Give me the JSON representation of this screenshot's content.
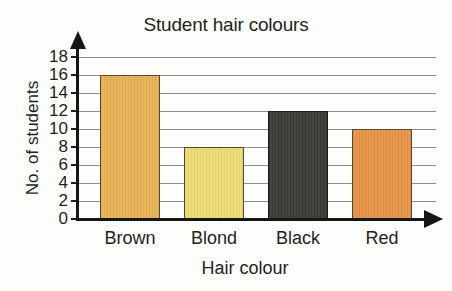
{
  "chart_data": {
    "type": "bar",
    "title": "Student hair colours",
    "xlabel": "Hair colour",
    "ylabel": "No. of students",
    "categories": [
      "Brown",
      "Blond",
      "Black",
      "Red"
    ],
    "values": [
      16,
      8,
      12,
      10
    ],
    "bar_colors": [
      "#e8b254",
      "#ecdc72",
      "#3a3936",
      "#e89247"
    ],
    "ylim": [
      0,
      18
    ],
    "ytick_step": 2,
    "ytick_labels": [
      "0",
      "2",
      "4",
      "6",
      "8",
      "10",
      "12",
      "14",
      "16",
      "18"
    ],
    "grid": true,
    "grid_axis": "y",
    "legend": false,
    "axis_arrows": true,
    "series": [
      {
        "name": "No. of students",
        "values": [
          16,
          8,
          12,
          10
        ]
      }
    ]
  },
  "colors": {
    "background": "#fdfdfc",
    "axis": "#161616",
    "gridline": "#8e8e8e",
    "text": "#231f1e"
  }
}
